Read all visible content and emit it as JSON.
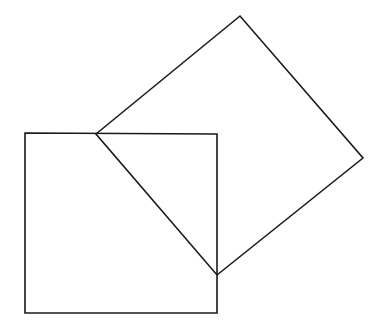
{
  "diagram": {
    "stroke_color": "#1a1a1a",
    "background": "#ffffff",
    "stroke_width": 1.6,
    "shapes": [
      {
        "name": "axis-aligned-square",
        "points": "25,133 217,134 217,313 25,313"
      },
      {
        "name": "rotated-square",
        "points": "96,134 240,16 363,158 217,275"
      }
    ]
  }
}
